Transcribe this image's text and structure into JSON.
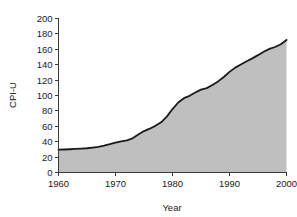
{
  "chart_data": {
    "type": "area",
    "title": "",
    "xlabel": "Year",
    "ylabel": "CPI-U",
    "xlim": [
      1960,
      2000
    ],
    "ylim": [
      0,
      200
    ],
    "grid": false,
    "legend": null,
    "xticks": [
      1960,
      1970,
      1980,
      1990,
      2000
    ],
    "yticks": [
      0,
      20,
      40,
      60,
      80,
      100,
      120,
      140,
      160,
      180,
      200
    ],
    "series_name": "CPI-U",
    "line_color": "#1a1a1a",
    "fill_color": "#bfbfbf",
    "x": [
      1960,
      1961,
      1962,
      1963,
      1964,
      1965,
      1966,
      1967,
      1968,
      1969,
      1970,
      1971,
      1972,
      1973,
      1974,
      1975,
      1976,
      1977,
      1978,
      1979,
      1980,
      1981,
      1982,
      1983,
      1984,
      1985,
      1986,
      1987,
      1988,
      1989,
      1990,
      1991,
      1992,
      1993,
      1994,
      1995,
      1996,
      1997,
      1998,
      1999,
      2000
    ],
    "values": [
      29.6,
      29.9,
      30.2,
      30.6,
      31.0,
      31.5,
      32.4,
      33.4,
      34.8,
      36.7,
      38.8,
      40.5,
      41.8,
      44.4,
      49.3,
      53.8,
      56.9,
      60.6,
      65.2,
      72.6,
      82.4,
      90.9,
      96.5,
      99.6,
      103.9,
      107.6,
      109.6,
      113.6,
      118.3,
      124.0,
      130.7,
      136.2,
      140.3,
      144.5,
      148.2,
      152.4,
      156.9,
      160.5,
      163.0,
      166.6,
      172.2
    ]
  },
  "axis_labels": {
    "y": [
      "200",
      "180",
      "160",
      "140",
      "120",
      "100",
      "80",
      "60",
      "40",
      "20",
      "0"
    ],
    "x": [
      "1960",
      "1970",
      "1980",
      "1990",
      "2000"
    ],
    "x_title": "Year",
    "y_title": "CPI-U"
  }
}
